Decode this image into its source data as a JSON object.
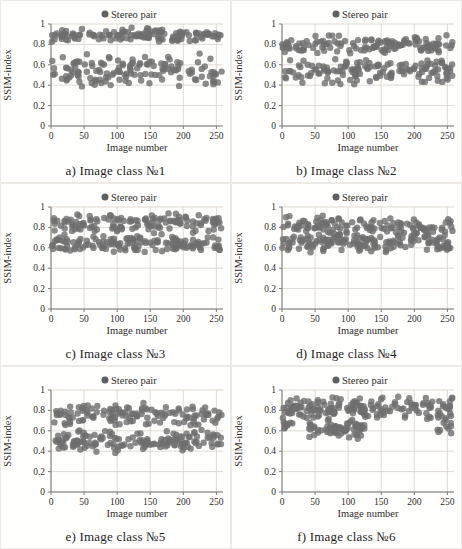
{
  "figure": {
    "name": "SSIM-index scatter figure",
    "rows": 3,
    "cols": 2
  },
  "colors": {
    "marker": "#6e6e6e",
    "marker_opacity": 0.8,
    "grid": "#d7cfc8",
    "axis": "#7d7873",
    "text": "#2f2c28",
    "legend_marker": "#5f5f5f",
    "panel_background": "#fffffe"
  },
  "chart_data": [
    {
      "type": "scatter",
      "caption": "a) Image class №1",
      "legend": [
        "Stereo pair"
      ],
      "xlabel": "Image number",
      "ylabel": "SSIM-index",
      "xlim": [
        0,
        260
      ],
      "ylim": [
        0,
        1
      ],
      "x_ticks": [
        0,
        50,
        100,
        150,
        200,
        250
      ],
      "y_ticks": [
        0,
        0.2,
        0.4,
        0.6,
        0.8,
        1
      ],
      "grid": true,
      "legend_position": "top-center",
      "seed": 11,
      "bands": [
        {
          "label": "upper cluster",
          "n": 130,
          "x": [
            0,
            258
          ],
          "y": [
            0.82,
            0.97
          ]
        },
        {
          "label": "lower cluster",
          "n": 135,
          "x": [
            0,
            258
          ],
          "y": [
            0.38,
            0.72
          ]
        }
      ]
    },
    {
      "type": "scatter",
      "caption": "b) Image class №2",
      "legend": [
        "Stereo pair"
      ],
      "xlabel": "Image number",
      "ylabel": "SSIM-index",
      "xlim": [
        0,
        260
      ],
      "ylim": [
        0,
        1
      ],
      "x_ticks": [
        0,
        50,
        100,
        150,
        200,
        250
      ],
      "y_ticks": [
        0,
        0.2,
        0.4,
        0.6,
        0.8,
        1
      ],
      "grid": true,
      "legend_position": "top-center",
      "seed": 22,
      "bands": [
        {
          "label": "upper cluster",
          "n": 130,
          "x": [
            0,
            258
          ],
          "y": [
            0.7,
            0.9
          ]
        },
        {
          "label": "lower cluster",
          "n": 140,
          "x": [
            0,
            258
          ],
          "y": [
            0.4,
            0.68
          ]
        }
      ]
    },
    {
      "type": "scatter",
      "caption": "c) Image class №3",
      "legend": [
        "Stereo pair"
      ],
      "xlabel": "Image number",
      "ylabel": "SSIM-index",
      "xlim": [
        0,
        260
      ],
      "ylim": [
        0,
        1
      ],
      "x_ticks": [
        0,
        50,
        100,
        150,
        200,
        250
      ],
      "y_ticks": [
        0,
        0.2,
        0.4,
        0.6,
        0.8,
        1
      ],
      "grid": true,
      "legend_position": "top-center",
      "seed": 33,
      "bands": [
        {
          "label": "upper cluster",
          "n": 130,
          "x": [
            0,
            258
          ],
          "y": [
            0.72,
            0.95
          ]
        },
        {
          "label": "lower cluster",
          "n": 140,
          "x": [
            0,
            258
          ],
          "y": [
            0.55,
            0.72
          ]
        }
      ]
    },
    {
      "type": "scatter",
      "caption": "d) Image class №4",
      "legend": [
        "Stereo pair"
      ],
      "xlabel": "Image number",
      "ylabel": "SSIM-index",
      "xlim": [
        0,
        260
      ],
      "ylim": [
        0,
        1
      ],
      "x_ticks": [
        0,
        50,
        100,
        150,
        200,
        250
      ],
      "y_ticks": [
        0,
        0.2,
        0.4,
        0.6,
        0.8,
        1
      ],
      "grid": true,
      "legend_position": "top-center",
      "seed": 44,
      "bands": [
        {
          "label": "upper cluster",
          "n": 130,
          "x": [
            0,
            258
          ],
          "y": [
            0.68,
            0.92
          ]
        },
        {
          "label": "lower cluster",
          "n": 140,
          "x": [
            0,
            258
          ],
          "y": [
            0.55,
            0.75
          ]
        }
      ]
    },
    {
      "type": "scatter",
      "caption": "e) Image class №5",
      "legend": [
        "Stereo pair"
      ],
      "xlabel": "Image number",
      "ylabel": "SSIM-index",
      "xlim": [
        0,
        260
      ],
      "ylim": [
        0,
        1
      ],
      "x_ticks": [
        0,
        50,
        100,
        150,
        200,
        250
      ],
      "y_ticks": [
        0,
        0.2,
        0.4,
        0.6,
        0.8,
        1
      ],
      "grid": true,
      "legend_position": "top-center",
      "seed": 55,
      "bands": [
        {
          "label": "upper cluster",
          "n": 130,
          "x": [
            0,
            258
          ],
          "y": [
            0.64,
            0.88
          ]
        },
        {
          "label": "lower cluster",
          "n": 145,
          "x": [
            0,
            258
          ],
          "y": [
            0.38,
            0.62
          ]
        }
      ]
    },
    {
      "type": "scatter",
      "caption": "f) Image class №6",
      "legend": [
        "Stereo pair"
      ],
      "xlabel": "Image number",
      "ylabel": "SSIM-index",
      "xlim": [
        0,
        260
      ],
      "ylim": [
        0,
        1
      ],
      "x_ticks": [
        0,
        50,
        100,
        150,
        200,
        250
      ],
      "y_ticks": [
        0,
        0.2,
        0.4,
        0.6,
        0.8,
        1
      ],
      "grid": true,
      "legend_position": "top-center",
      "seed": 66,
      "bands": [
        {
          "label": "main upper band",
          "n": 170,
          "x": [
            0,
            258
          ],
          "y": [
            0.7,
            0.95
          ]
        },
        {
          "label": "mid-range dip cluster",
          "n": 60,
          "x": [
            40,
            125
          ],
          "y": [
            0.52,
            0.72
          ]
        },
        {
          "label": "right-end dip",
          "n": 12,
          "x": [
            235,
            258
          ],
          "y": [
            0.55,
            0.75
          ]
        },
        {
          "label": "left-end dip",
          "n": 10,
          "x": [
            0,
            20
          ],
          "y": [
            0.58,
            0.75
          ]
        }
      ]
    }
  ]
}
